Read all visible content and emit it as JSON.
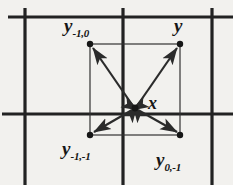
{
  "figure": {
    "width": 233,
    "height": 185,
    "background_color": "#f2f1ee",
    "ink_color": "#161616"
  },
  "labels": {
    "top_left": {
      "base": "y",
      "sub": "-1,0"
    },
    "top_right": {
      "base": "y",
      "sub": ""
    },
    "bottom_left": {
      "base": "y",
      "sub": "-1,-1"
    },
    "bottom_right": {
      "base": "y",
      "sub": "0,-1"
    },
    "center": {
      "base": "x",
      "sub": ""
    }
  },
  "grid": {
    "line_color": "#222222",
    "line_width": 3.2,
    "vertical_x": [
      25,
      123,
      212
    ],
    "horizontal_y": [
      17,
      114
    ]
  },
  "inner_rect": {
    "line_color": "#333333",
    "line_width": 1.2,
    "left": 90,
    "top": 44,
    "right": 180,
    "bottom": 135
  },
  "points": {
    "radius": 3.2,
    "color": "#161616",
    "center": {
      "id": "x",
      "cx": 135,
      "cy": 108
    },
    "corners": [
      {
        "id": "y-top-left",
        "cx": 90,
        "cy": 44
      },
      {
        "id": "y-top-right",
        "cx": 180,
        "cy": 44
      },
      {
        "id": "y-bottom-left",
        "cx": 90,
        "cy": 135
      },
      {
        "id": "y-bottom-right",
        "cx": 180,
        "cy": 135
      }
    ]
  },
  "arrows": {
    "style": "double-headed",
    "color": "#2b2b2b",
    "line_width": 2.2,
    "items": [
      {
        "id": "arrow-to-top-left",
        "from": [
          135,
          108
        ],
        "to": [
          90,
          44
        ]
      },
      {
        "id": "arrow-to-top-right",
        "from": [
          135,
          108
        ],
        "to": [
          180,
          44
        ]
      },
      {
        "id": "arrow-to-bottom-left",
        "from": [
          135,
          108
        ],
        "to": [
          90,
          135
        ]
      },
      {
        "id": "arrow-to-bottom-right",
        "from": [
          135,
          108
        ],
        "to": [
          180,
          135
        ]
      }
    ]
  }
}
